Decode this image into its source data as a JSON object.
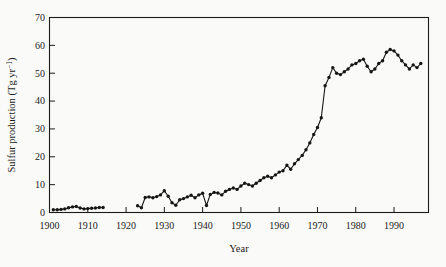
{
  "figure": {
    "kind": "printed line chart",
    "background": "#fafaf8",
    "ink_color": "#1a1a1a"
  },
  "chart_data": {
    "type": "line",
    "title": "",
    "xlabel": "Year",
    "ylabel": "Sulfur production (Tg yr−1)",
    "ylabel_parts": {
      "prefix": "Sulfur production (Tg yr",
      "sup": "−1",
      "suffix": ")"
    },
    "xlim": [
      1900,
      1999
    ],
    "ylim": [
      0,
      70
    ],
    "xticks": [
      1900,
      1910,
      1920,
      1930,
      1940,
      1950,
      1960,
      1970,
      1980,
      1990
    ],
    "yticks": [
      0,
      10,
      20,
      30,
      40,
      50,
      60,
      70
    ],
    "grid": false,
    "legend": "none",
    "marker": "filled-circle",
    "line_color": "#161616",
    "frame": "full-box",
    "tick_direction": "in",
    "series": [
      {
        "name": "sulfur-production-1901-1914",
        "points": [
          [
            1901,
            1.0
          ],
          [
            1902,
            1.0
          ],
          [
            1903,
            1.1
          ],
          [
            1904,
            1.3
          ],
          [
            1905,
            1.7
          ],
          [
            1906,
            2.0
          ],
          [
            1907,
            2.2
          ],
          [
            1908,
            1.6
          ],
          [
            1909,
            1.3
          ],
          [
            1910,
            1.4
          ],
          [
            1911,
            1.5
          ],
          [
            1912,
            1.6
          ],
          [
            1913,
            1.8
          ],
          [
            1914,
            1.8
          ]
        ]
      },
      {
        "name": "sulfur-production-1923-1997",
        "points": [
          [
            1923,
            2.4
          ],
          [
            1924,
            1.7
          ],
          [
            1925,
            5.4
          ],
          [
            1926,
            5.6
          ],
          [
            1927,
            5.3
          ],
          [
            1928,
            5.7
          ],
          [
            1929,
            6.3
          ],
          [
            1930,
            7.8
          ],
          [
            1931,
            5.8
          ],
          [
            1932,
            3.5
          ],
          [
            1933,
            2.6
          ],
          [
            1934,
            4.6
          ],
          [
            1935,
            5.0
          ],
          [
            1936,
            5.6
          ],
          [
            1937,
            6.2
          ],
          [
            1938,
            5.3
          ],
          [
            1939,
            6.3
          ],
          [
            1940,
            6.9
          ],
          [
            1941,
            2.5
          ],
          [
            1942,
            6.5
          ],
          [
            1943,
            7.2
          ],
          [
            1944,
            7.0
          ],
          [
            1945,
            6.3
          ],
          [
            1946,
            7.6
          ],
          [
            1947,
            8.3
          ],
          [
            1948,
            8.8
          ],
          [
            1949,
            8.3
          ],
          [
            1950,
            9.5
          ],
          [
            1951,
            10.5
          ],
          [
            1952,
            10.0
          ],
          [
            1953,
            9.5
          ],
          [
            1954,
            10.5
          ],
          [
            1955,
            11.5
          ],
          [
            1956,
            12.5
          ],
          [
            1957,
            13.0
          ],
          [
            1958,
            12.5
          ],
          [
            1959,
            13.5
          ],
          [
            1960,
            14.5
          ],
          [
            1961,
            15.0
          ],
          [
            1962,
            17.0
          ],
          [
            1963,
            15.5
          ],
          [
            1964,
            17.5
          ],
          [
            1965,
            19.0
          ],
          [
            1966,
            20.5
          ],
          [
            1967,
            22.5
          ],
          [
            1968,
            25.0
          ],
          [
            1969,
            28.0
          ],
          [
            1970,
            30.5
          ],
          [
            1971,
            34.0
          ],
          [
            1972,
            45.5
          ],
          [
            1973,
            48.5
          ],
          [
            1974,
            52.0
          ],
          [
            1975,
            50.0
          ],
          [
            1976,
            49.5
          ],
          [
            1977,
            50.5
          ],
          [
            1978,
            51.5
          ],
          [
            1979,
            53.0
          ],
          [
            1980,
            53.5
          ],
          [
            1981,
            54.5
          ],
          [
            1982,
            55.0
          ],
          [
            1983,
            52.5
          ],
          [
            1984,
            50.5
          ],
          [
            1985,
            51.5
          ],
          [
            1986,
            53.5
          ],
          [
            1987,
            54.5
          ],
          [
            1988,
            57.5
          ],
          [
            1989,
            58.5
          ],
          [
            1990,
            58.0
          ],
          [
            1991,
            56.5
          ],
          [
            1992,
            54.5
          ],
          [
            1993,
            53.0
          ],
          [
            1994,
            51.5
          ],
          [
            1995,
            53.0
          ],
          [
            1996,
            52.0
          ],
          [
            1997,
            53.5
          ]
        ]
      }
    ]
  }
}
